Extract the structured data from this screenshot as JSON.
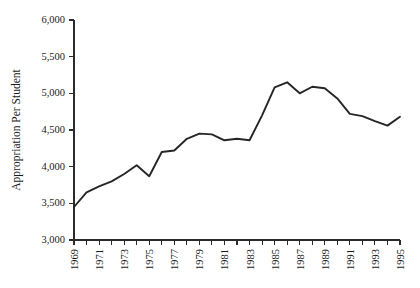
{
  "chart_data": {
    "type": "line",
    "title": "",
    "xlabel": "",
    "ylabel": "Appropriation Per Student",
    "xlim": [
      1969,
      1995
    ],
    "ylim": [
      3000,
      6000
    ],
    "grid": false,
    "legend": "none",
    "y_ticks": [
      3000,
      3500,
      4000,
      4500,
      5000,
      5500,
      6000
    ],
    "y_tick_labels": [
      "3,000",
      "3,500",
      "4,000",
      "4,500",
      "5,000",
      "5,500",
      "6,000"
    ],
    "x_ticks": [
      1969,
      1970,
      1971,
      1972,
      1973,
      1974,
      1975,
      1976,
      1977,
      1978,
      1979,
      1980,
      1981,
      1982,
      1983,
      1984,
      1985,
      1986,
      1987,
      1988,
      1989,
      1990,
      1991,
      1992,
      1993,
      1994,
      1995
    ],
    "x_tick_labels": [
      "1969",
      "",
      "1971",
      "",
      "1973",
      "",
      "1975",
      "",
      "1977",
      "",
      "1979",
      "",
      "1981",
      "",
      "1983",
      "",
      "1985",
      "",
      "1987",
      "",
      "1989",
      "",
      "1991",
      "",
      "1993",
      "",
      "1995"
    ],
    "x": [
      1969,
      1970,
      1971,
      1972,
      1973,
      1974,
      1975,
      1976,
      1977,
      1978,
      1979,
      1980,
      1981,
      1982,
      1983,
      1984,
      1985,
      1986,
      1987,
      1988,
      1989,
      1990,
      1991,
      1992,
      1993,
      1994,
      1995
    ],
    "values": [
      3450,
      3650,
      3730,
      3800,
      3900,
      4020,
      3870,
      4200,
      4220,
      4380,
      4450,
      4440,
      4360,
      4380,
      4360,
      4700,
      5080,
      5150,
      5000,
      5090,
      5070,
      4930,
      4720,
      4690,
      4620,
      4560,
      4680
    ],
    "series": [
      {
        "name": "Appropriation Per Student",
        "color": "#262626",
        "values": [
          3450,
          3650,
          3730,
          3800,
          3900,
          4020,
          3870,
          4200,
          4220,
          4380,
          4450,
          4440,
          4360,
          4380,
          4360,
          4700,
          5080,
          5150,
          5000,
          5090,
          5070,
          4930,
          4720,
          4690,
          4620,
          4560,
          4680
        ]
      }
    ],
    "axis_color": "#2b2b2b"
  }
}
